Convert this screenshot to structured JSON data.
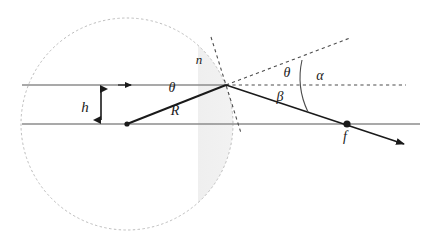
{
  "figure": {
    "type": "optics-ray-diagram",
    "background_color": "#ffffff"
  },
  "labels": {
    "height": "h",
    "refractive_index": "n",
    "radius": "R",
    "focal_point": "f",
    "incidence_angle": "θ",
    "refraction_angle": "θ",
    "deviation_angle": "α",
    "beta_angle": "β"
  },
  "colors": {
    "ray_gray": "#8c8c8c",
    "ray_black": "#1a1a1a",
    "dashed_circle": "#b5b5b5",
    "dashed_line": "#555555",
    "lens_fill": "#e3e3e3",
    "label_text": "#1a1a1a"
  },
  "geometry": {
    "circle_center": {
      "x": 127,
      "y": 124
    },
    "circle_radius": 106,
    "optical_axis_y": 124,
    "incident_ray_y": 85,
    "vertex": {
      "x": 226,
      "y": 85
    },
    "focal_point": {
      "x": 347,
      "y": 124
    },
    "lens_flat_edge_x": 198,
    "ray_height_h": 39
  },
  "elements": {
    "dashed_circle_name": "construction-circle",
    "lens_name": "plano-convex-lens-body",
    "incident_ray_name": "incident-ray",
    "optical_axis_name": "optical-axis",
    "radius_segment_name": "radius-segment",
    "refracted_ray_name": "refracted-ray",
    "normal_line_name": "surface-normal-dashed",
    "extension_ray_name": "undeviated-ray-dashed",
    "axis_extension_name": "axis-extension-dashed",
    "angle_arc_name": "angle-arc",
    "height_arrow_name": "height-dimension-arrow"
  }
}
